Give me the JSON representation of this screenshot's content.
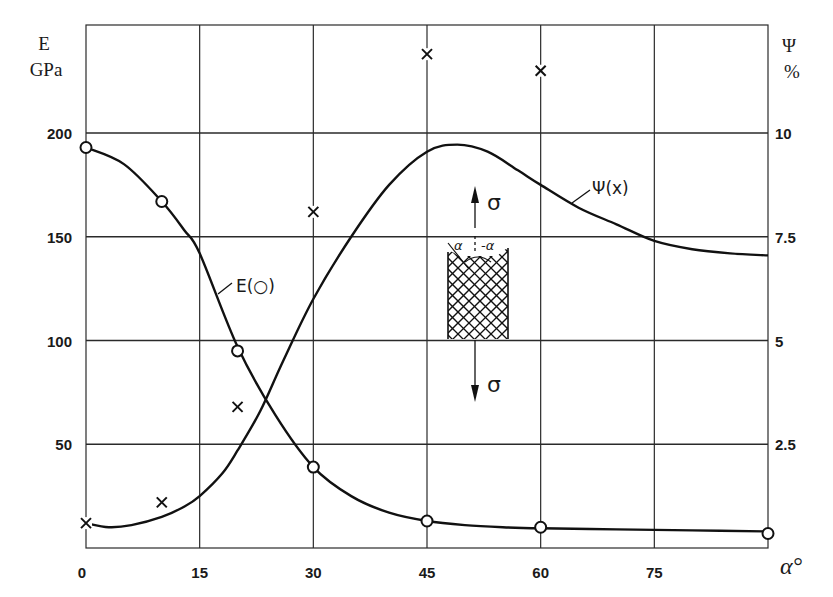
{
  "chart_data": {
    "type": "line",
    "title": "",
    "xlabel": "α°",
    "ylabel_left": "E GPa",
    "ylabel_left_symbol": "E",
    "ylabel_left_unit": "GPa",
    "ylabel_right": "Ψ %",
    "ylabel_right_symbol": "Ψ",
    "ylabel_right_unit": "%",
    "xlim": [
      0,
      90
    ],
    "ylim_left": [
      0,
      250
    ],
    "ylim_right": [
      0,
      12.5
    ],
    "x_ticks": [
      "0",
      "15",
      "30",
      "45",
      "60",
      "75"
    ],
    "x_tick_values": [
      0,
      15,
      30,
      45,
      60,
      75
    ],
    "y_left_ticks": [
      "50",
      "100",
      "150",
      "200"
    ],
    "y_left_tick_values": [
      50,
      100,
      150,
      200
    ],
    "y_right_ticks": [
      "2.5",
      "5",
      "7.5",
      "10"
    ],
    "y_right_tick_values": [
      2.5,
      5,
      7.5,
      10
    ],
    "grid": true,
    "series": [
      {
        "name": "E(o)",
        "label": "E(○)",
        "axis": "left",
        "marker": "circle",
        "points_x": [
          0,
          10,
          20,
          30,
          45,
          60,
          90
        ],
        "points_y": [
          193,
          167,
          95,
          39,
          13,
          10,
          7
        ],
        "curve_x": [
          0,
          5,
          10,
          13,
          15,
          20,
          25,
          30,
          35,
          40,
          45,
          50,
          55,
          60,
          70,
          80,
          90
        ],
        "curve_y": [
          193,
          185,
          167,
          153,
          142,
          97,
          64,
          39,
          25,
          17,
          13,
          11,
          10,
          9.5,
          9,
          8.5,
          8
        ]
      },
      {
        "name": "Ψ(x)",
        "label": "Ψ(x)",
        "axis": "right",
        "marker": "x",
        "points_x": [
          0,
          10,
          20,
          30,
          45,
          60
        ],
        "points_y": [
          0.6,
          1.1,
          3.4,
          8.1,
          11.9,
          11.5
        ],
        "curve_x": [
          0,
          3,
          6,
          10,
          13,
          15,
          18,
          20,
          23,
          26,
          30,
          35,
          40,
          45,
          49,
          53,
          57,
          60,
          65,
          70,
          75,
          80,
          85,
          90
        ],
        "curve_y": [
          0.6,
          0.5,
          0.55,
          0.75,
          1.0,
          1.25,
          1.8,
          2.35,
          3.3,
          4.5,
          6.0,
          7.5,
          8.75,
          9.55,
          9.72,
          9.55,
          9.1,
          8.75,
          8.2,
          7.8,
          7.4,
          7.2,
          7.1,
          7.05
        ]
      }
    ],
    "annotations": [
      {
        "text": "E(○)",
        "target": "E curve"
      },
      {
        "text": "Ψ(x)",
        "target": "Ψ curve"
      },
      {
        "text": "σ",
        "position": "inset top arrow"
      },
      {
        "text": "σ",
        "position": "inset bottom arrow"
      },
      {
        "text": "α",
        "position": "inset left fiber angle"
      },
      {
        "text": "-α",
        "position": "inset right fiber angle"
      }
    ],
    "legend": "none (curves labeled inline)"
  },
  "labels": {
    "left_symbol": "E",
    "left_unit": "GPa",
    "right_symbol": "Ψ",
    "right_unit": "%",
    "x_axis": "α°",
    "x_alpha": "α",
    "x_degree": "°",
    "e_curve": "E(○)",
    "psi_curve": "Ψ(x)",
    "sigma_top": "σ",
    "sigma_bottom": "σ",
    "inset_alpha": "α",
    "inset_minus_alpha": "-α"
  }
}
